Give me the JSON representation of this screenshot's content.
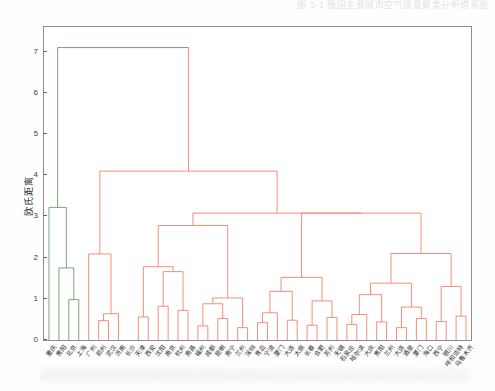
{
  "header": {
    "cutoff_text": "图 3-1   我国主要城市空气质量聚类分析谱系图"
  },
  "axes": {
    "ylabel": "欧氏距离",
    "yticks": [
      0,
      1,
      2,
      3,
      4,
      5,
      6,
      7
    ],
    "ylim": [
      0,
      7.6
    ],
    "grid": false
  },
  "colors": {
    "link_main": "#f4816a",
    "link_green": "#6f9a6f",
    "link_blue": "#6a7fb5",
    "axis": "#8e8e8e",
    "text": "#2b2b2b"
  },
  "chart_data": {
    "type": "dendrogram",
    "title": "",
    "xlabel": "",
    "ylabel": "欧氏距离",
    "ylim": [
      0,
      7.6
    ],
    "grid": false,
    "legend": "none",
    "leaf_labels": [
      "重庆",
      "贵阳",
      "北京",
      "上海",
      "广州",
      "郑州",
      "武汉",
      "济南",
      "长沙",
      "天津",
      "西安",
      "沈阳",
      "南京",
      "杭州",
      "南昌",
      "福州",
      "成都",
      "昆明",
      "南宁",
      "兰州",
      "深圳",
      "青岛",
      "宁波",
      "厦门",
      "大连",
      "太原",
      "长春",
      "合肥",
      "苏州",
      "无锡",
      "石家庄",
      "哈尔滨",
      "大庆",
      "贵阳",
      "兰州",
      "大连",
      "酒泉",
      "厦门",
      "海口",
      "西宁",
      "银川",
      "呼和浩特",
      "乌鲁木齐"
    ],
    "merges": [
      {
        "id": "m1",
        "height": 0.98,
        "note": "北京+上海"
      },
      {
        "id": "m2",
        "height": 1.75,
        "note": "贵阳+(北京,上海)"
      },
      {
        "id": "m3",
        "height": 3.22,
        "note": "重庆+green-cluster"
      },
      {
        "id": "m4",
        "height": 0.47,
        "note": "郑州+武汉"
      },
      {
        "id": "m5",
        "height": 0.64,
        "note": "(郑州,武汉)+济南"
      },
      {
        "id": "m6",
        "height": 2.09,
        "note": "广州+small"
      },
      {
        "id": "m7",
        "height": 0.56,
        "note": "长沙+天津"
      },
      {
        "id": "m8",
        "height": 0.82,
        "note": "西安+沈阳"
      },
      {
        "id": "m9",
        "height": 0.72,
        "note": "南京+杭州"
      },
      {
        "id": "m10",
        "height": 1.66,
        "note": "mid-right pair"
      },
      {
        "id": "m11",
        "height": 1.78,
        "note": "left-of-centre"
      },
      {
        "id": "m12",
        "height": 2.78,
        "note": "upper mid"
      },
      {
        "id": "m13",
        "height": 1.02,
        "note": "福州+成都"
      },
      {
        "id": "m14",
        "height": 0.34,
        "note": "昆明+南宁"
      },
      {
        "id": "m15",
        "height": 0.52,
        "note": "兰州+深圳"
      },
      {
        "id": "m16",
        "height": 0.3,
        "note": "青岛+宁波"
      },
      {
        "id": "m17",
        "height": 0.66,
        "note": "厦门+大连"
      },
      {
        "id": "m18",
        "height": 0.88,
        "note": "太原group"
      },
      {
        "id": "m19",
        "height": 0.42,
        "note": "长春+合肥"
      },
      {
        "id": "m20",
        "height": 0.75,
        "note": "苏州+无锡"
      },
      {
        "id": "m21",
        "height": 1.18,
        "note": "石家庄cluster"
      },
      {
        "id": "m22",
        "height": 0.48,
        "note": "哈尔滨+大庆"
      },
      {
        "id": "m23",
        "height": 0.62,
        "note": "贵阳+兰州"
      },
      {
        "id": "m24",
        "height": 1.52,
        "note": "大连cluster"
      },
      {
        "id": "m25",
        "height": 0.36,
        "note": "酒泉+厦门"
      },
      {
        "id": "m26",
        "height": 0.55,
        "note": "海口+西宁"
      },
      {
        "id": "m27",
        "height": 0.58,
        "note": "银川+呼和浩特"
      },
      {
        "id": "m28",
        "height": 3.08,
        "note": "big right group"
      },
      {
        "id": "m29",
        "height": 4.1,
        "note": "orange root"
      },
      {
        "id": "m30",
        "height": 7.1,
        "note": "root"
      }
    ],
    "root_height": 7.1,
    "n_leaves": 43,
    "color_threshold_note": "two colour clusters: green (4 leaves, left) and orange (remaining), joined at root height 7.1 in blue"
  }
}
